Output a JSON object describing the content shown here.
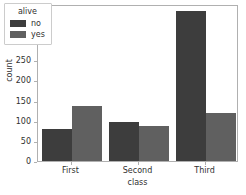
{
  "chart_data": {
    "type": "bar",
    "title": "",
    "xlabel": "class",
    "ylabel": "count",
    "categories": [
      "First",
      "Second",
      "Third"
    ],
    "series": [
      {
        "name": "no",
        "color": "#3d3d3d",
        "values": [
          80,
          97,
          372
        ]
      },
      {
        "name": "yes",
        "color": "#606060",
        "values": [
          136,
          87,
          119
        ]
      }
    ],
    "legend": {
      "title": "alive",
      "position": "upper-left",
      "entries": [
        {
          "label": "no",
          "color": "#3d3d3d"
        },
        {
          "label": "yes",
          "color": "#606060"
        }
      ]
    },
    "ylim": [
      0,
      390
    ],
    "yticks": [
      0,
      50,
      100,
      150,
      200,
      250,
      300,
      350
    ],
    "ytick_labels": [
      "0",
      "50",
      "100",
      "150",
      "200",
      "250",
      "300",
      "350"
    ],
    "xtick_labels": [
      "First",
      "Second",
      "Third"
    ],
    "grid": false,
    "axis_color": "#b0b0b0",
    "text_color": "#303030",
    "background": "#ffffff"
  }
}
